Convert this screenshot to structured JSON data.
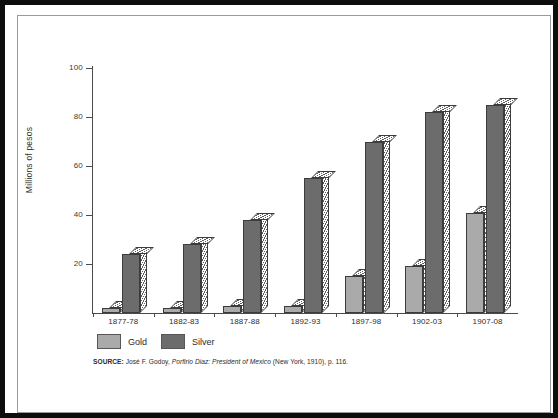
{
  "chart_data": {
    "type": "bar",
    "title": "",
    "xlabel": "",
    "ylabel": "Millions of pesos",
    "ylim": [
      0,
      100
    ],
    "yticks": [
      0,
      20,
      40,
      60,
      80,
      100
    ],
    "ytick_labels": [
      "",
      "20",
      "40",
      "60",
      "80",
      "100"
    ],
    "grid": false,
    "legend_position": "below-axes-left",
    "categories": [
      "1877-78",
      "1882-83",
      "1887-88",
      "1892-93",
      "1897-98",
      "1902-03",
      "1907-08"
    ],
    "series": [
      {
        "name": "Gold",
        "color": "#aaaaaa",
        "values": [
          2,
          2,
          3,
          3,
          15,
          19,
          41
        ]
      },
      {
        "name": "Silver",
        "color": "#6c6c6c",
        "values": [
          24,
          28,
          38,
          55,
          70,
          82,
          85
        ]
      }
    ],
    "source_note": {
      "label": "SOURCE:",
      "author": "José F. Godoy,",
      "title": "Porfirio Diaz: President of Mexico",
      "publication": "(New York, 1910), p. 116."
    }
  },
  "legend": {
    "items": [
      {
        "label": "Gold",
        "color": "#aaaaaa"
      },
      {
        "label": "Silver",
        "color": "#6c6c6c"
      }
    ]
  },
  "axes": {
    "y_title": "Millions of pesos"
  }
}
